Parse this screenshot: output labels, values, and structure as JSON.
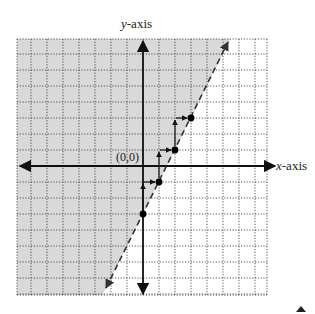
{
  "chart_data": {
    "type": "line",
    "title": "",
    "xlabel": "x-axis",
    "ylabel": "y-axis",
    "origin_label": "(0,0)",
    "grid": true,
    "grid_style": "dotted",
    "xlim": [
      -8,
      7.7
    ],
    "ylim": [
      -8,
      8
    ],
    "boundary_line": {
      "slope": 2,
      "intercept": -3,
      "style": "dashed",
      "equation": "y = 2x - 3"
    },
    "shaded_region": "y > 2x - 3",
    "points": [
      {
        "x": 0,
        "y": -3
      },
      {
        "x": 1,
        "y": -1
      },
      {
        "x": 2,
        "y": 1
      },
      {
        "x": 3,
        "y": 3
      }
    ],
    "slope_steps": [
      {
        "from": [
          0,
          -3
        ],
        "rise": 2,
        "run": 1
      },
      {
        "from": [
          1,
          -1
        ],
        "rise": 2,
        "run": 1
      },
      {
        "from": [
          2,
          1
        ],
        "rise": 2,
        "run": 1
      }
    ]
  },
  "labels": {
    "x_axis_var": "x",
    "x_axis_suffix": "-axis",
    "y_axis_var": "y",
    "y_axis_suffix": "-axis",
    "origin": "(0,0)"
  },
  "colors": {
    "shade": "#d9d9d9",
    "grid": "#555555",
    "axis": "#111111",
    "line": "#333333",
    "point": "#000000"
  }
}
